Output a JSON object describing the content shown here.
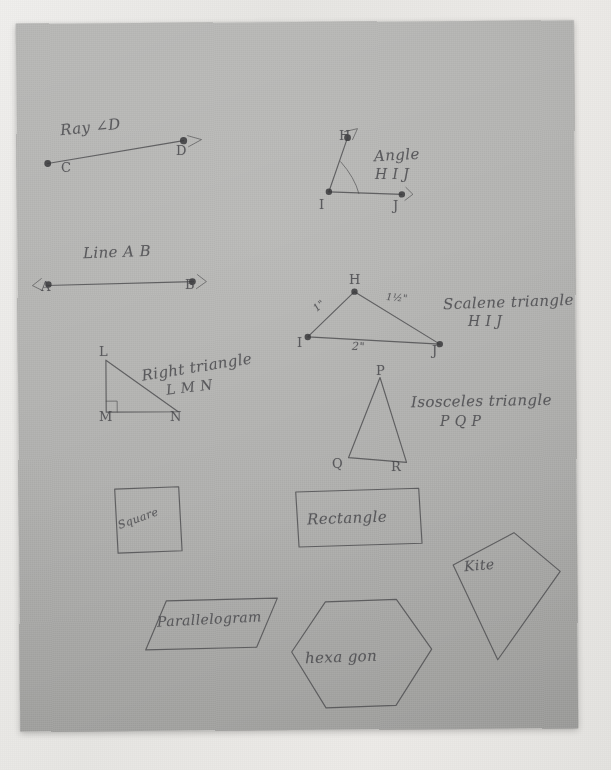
{
  "sheet": {
    "media": "photograph of a gray sheet of paper with pencil geometry drawings",
    "ink_color": "#4d4d4f",
    "paper_color": "#b3b3b1",
    "backdrop_color": "#eceae7"
  },
  "figures": {
    "ray": {
      "caption": "Ray  ∠D",
      "caption_plain": "Ray CD",
      "point_c": "C",
      "point_d": "D"
    },
    "angle": {
      "caption_line1": "Angle",
      "caption_line2": "H I J",
      "point_h": "H",
      "point_i": "I",
      "point_j": "J"
    },
    "line": {
      "caption": "Line A B",
      "point_a": "A",
      "point_b": "B"
    },
    "scalene": {
      "caption_line1": "Scalene triangle",
      "caption_line2": "H I J",
      "point_h": "H",
      "point_i": "I",
      "point_j": "J",
      "side_hi": "1\"",
      "side_hj": "1½\"",
      "side_ij": "2\""
    },
    "right_triangle": {
      "caption_line1": "Right triangle",
      "caption_line2": "L M N",
      "point_l": "L",
      "point_m": "M",
      "point_n": "N"
    },
    "isosceles": {
      "caption_line1": "Isosceles triangle",
      "caption_line2": "P Q P",
      "point_p": "P",
      "point_q": "Q",
      "point_r": "R"
    },
    "square": {
      "label": "Square"
    },
    "rectangle": {
      "label": "Rectangle"
    },
    "kite": {
      "label": "Kite"
    },
    "parallelogram": {
      "label": "Parallelogram"
    },
    "hexagon": {
      "label": "hexa gon"
    }
  }
}
